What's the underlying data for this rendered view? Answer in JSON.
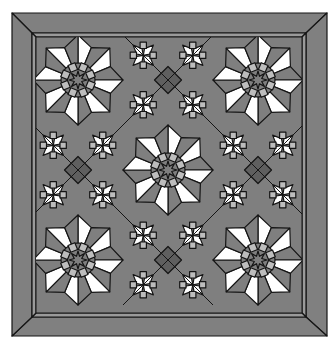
{
  "image": {
    "subject": "quilt-pattern",
    "canvas": {
      "width": 335,
      "height": 348,
      "background": "#ffffff"
    }
  },
  "frame": {
    "outer": {
      "x": 12,
      "y": 13,
      "w": 315,
      "h": 323
    },
    "inner": {
      "x": 32,
      "y": 33,
      "w": 274,
      "h": 284
    },
    "strip_inset": 4,
    "color": "#808080",
    "strip_color": "#9a9a9a",
    "line_color": "#1a1a1a"
  },
  "grid": {
    "origin": {
      "x": 33,
      "y": 35
    },
    "cell": 90,
    "cells": 3,
    "star_positions": [
      [
        0,
        0
      ],
      [
        2,
        0
      ],
      [
        1,
        1
      ],
      [
        0,
        2
      ],
      [
        2,
        2
      ]
    ],
    "pinwheel_positions": [
      [
        1,
        0
      ],
      [
        0,
        1
      ],
      [
        2,
        1
      ],
      [
        1,
        2
      ]
    ]
  },
  "colors": {
    "white": "#ffffff",
    "mid_gray": "#7f7f7f",
    "light_gray": "#bdbdbd",
    "dark_gray": "#5f5f5f",
    "line": "#151515"
  }
}
